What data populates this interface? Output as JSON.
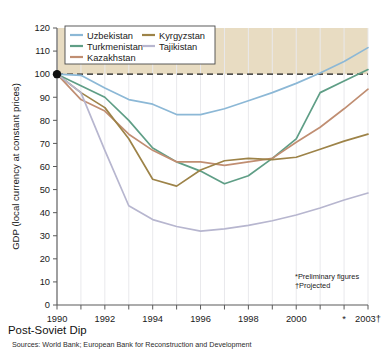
{
  "chart_data": {
    "type": "line",
    "title": "Post-Soviet Dip",
    "xlabel": "",
    "ylabel": "GDP (local currency at constant prices)",
    "xlim": [
      1990,
      2003
    ],
    "ylim": [
      0,
      120
    ],
    "ytick_step": 10,
    "yticks": [
      "0",
      "10",
      "20",
      "30",
      "40",
      "50",
      "60",
      "70",
      "80",
      "90",
      "100",
      "110",
      "120"
    ],
    "xticks": [
      "1990",
      "1992",
      "1994",
      "1996",
      "1998",
      "2000",
      "*",
      "2003†"
    ],
    "xtick_values": [
      1990,
      1992,
      1994,
      1996,
      1998,
      2000,
      2002,
      2003
    ],
    "grid": "vertical-only",
    "legend_position": "top-left-inside",
    "reference_line": {
      "value": 100,
      "style": "dashed",
      "label": "100 = 1990 level"
    },
    "shaded_region": {
      "from": 100,
      "to": 120,
      "color": "#e8dcc2",
      "note": "above-1990-level band"
    },
    "x": [
      1990,
      1991,
      1992,
      1993,
      1994,
      1995,
      1996,
      1997,
      1998,
      1999,
      2000,
      2001,
      2002,
      2003
    ],
    "series": [
      {
        "name": "Uzbekistan",
        "color": "#8cb8d6",
        "values": [
          100,
          99.5,
          94,
          89,
          87,
          82.5,
          82.5,
          85,
          88.5,
          92,
          96,
          100.5,
          105.5,
          111.5
        ]
      },
      {
        "name": "Turkmenistan",
        "color": "#5f9e86",
        "values": [
          100,
          95,
          90,
          80,
          68,
          62,
          58,
          52.5,
          56,
          63.5,
          72,
          92,
          97,
          102
        ]
      },
      {
        "name": "Kazakhstan",
        "color": "#c08e72",
        "values": [
          100,
          89,
          84,
          74,
          67,
          62,
          62,
          60.5,
          62,
          63.5,
          70.5,
          77,
          85,
          93.5
        ]
      },
      {
        "name": "Kyrgyzstan",
        "color": "#9d8348",
        "values": [
          100,
          92,
          85.5,
          72,
          54.5,
          51.5,
          58.5,
          62.5,
          63.5,
          63,
          64,
          67.5,
          71,
          74
        ]
      },
      {
        "name": "Tajikistan",
        "color": "#b7b6cf",
        "values": [
          100,
          92,
          67,
          43,
          37,
          34,
          32,
          33,
          34.5,
          36.5,
          39,
          42,
          45.5,
          48.5
        ]
      }
    ],
    "annotations": [
      {
        "text": "*Preliminary figures"
      },
      {
        "text": "†Projected"
      }
    ],
    "sources": "Sources: World Bank; European Bank for Reconstruction and Development"
  }
}
